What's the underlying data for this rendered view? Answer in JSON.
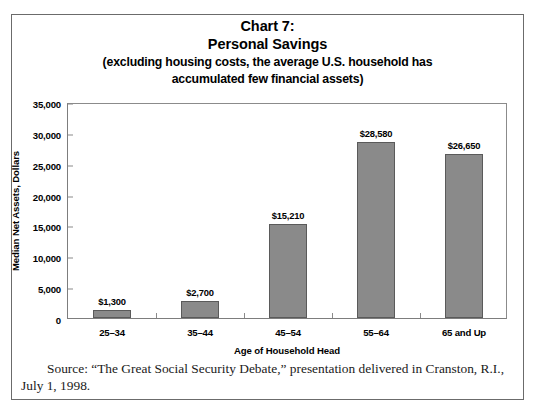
{
  "figure": {
    "title_line_1": "Chart 7:",
    "title_line_2": "Personal Savings",
    "subtitle_line_1": "(excluding housing costs, the average U.S. household has",
    "subtitle_line_2": "accumulated few financial assets)",
    "source_note": "Source: “The Great Social Security Debate,” presentation delivered in Cranston, R.I., July 1, 1998.",
    "frame_color": "#6b6b6b"
  },
  "chart_data": {
    "type": "bar",
    "title": "Chart 7: Personal Savings (excluding housing costs, the average U.S. household has accumulated few financial assets)",
    "categories": [
      "25–34",
      "35–44",
      "45–54",
      "55–64",
      "65 and Up"
    ],
    "values": [
      1300,
      2700,
      15210,
      28580,
      26650
    ],
    "data_labels": [
      "$1,300",
      "$2,700",
      "$15,210",
      "$28,580",
      "$26,650"
    ],
    "xlabel": "Age of Household Head",
    "ylabel": "Median Net Assets, Dollars",
    "ylim": [
      0,
      35000
    ],
    "ytick_values": [
      0,
      5000,
      10000,
      15000,
      20000,
      25000,
      30000,
      35000
    ],
    "ytick_labels": [
      "0",
      "5,000",
      "10,000",
      "15,000",
      "20,000",
      "25,000",
      "30,000",
      "35,000"
    ],
    "grid": false,
    "legend": false,
    "bar_color": "#8a8a8a",
    "bar_edge_color": "#5a5a5a"
  }
}
